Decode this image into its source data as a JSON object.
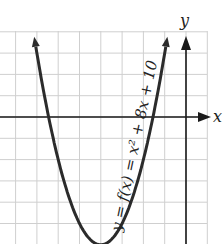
{
  "chart_data": {
    "type": "line",
    "title": "",
    "equation_label": "y = f(x) = x² + 8x + 10",
    "function": "x^2 + 8x + 10",
    "xlabel": "x",
    "ylabel": "y",
    "xlim": [
      -8.8,
      1.0
    ],
    "ylim": [
      -6.0,
      4.0
    ],
    "grid": true,
    "grid_step": 1,
    "tick_labels": "none",
    "series": [
      {
        "name": "f(x)",
        "x": [
          -7.16,
          -7,
          -6.45,
          -6,
          -5,
          -4,
          -3,
          -2,
          -1.55,
          -1,
          -0.84
        ],
        "y": [
          4.0,
          3,
          0,
          -2,
          -5,
          -6,
          -5,
          -2,
          0,
          3,
          4.0
        ]
      }
    ],
    "vertex": {
      "x": -4,
      "y": -6
    },
    "x_intercepts": [
      -6.45,
      -1.55
    ],
    "colors": {
      "curve": "#2b2b2b",
      "axis": "#1a1a1a",
      "grid": "#cfcfcf"
    }
  }
}
